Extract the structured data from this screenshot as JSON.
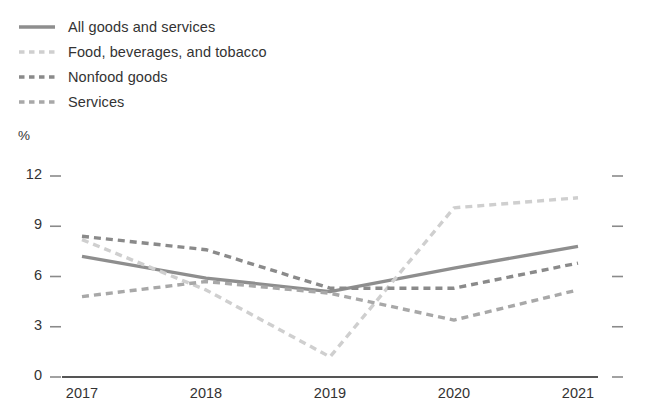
{
  "chart_data": {
    "type": "line",
    "title": "",
    "xlabel": "",
    "ylabel": "%",
    "unit_label": "%",
    "categories": [
      "2017",
      "2018",
      "2019",
      "2020",
      "2021"
    ],
    "x": [
      2017,
      2018,
      2019,
      2020,
      2021
    ],
    "ylim": [
      0,
      12
    ],
    "yticks": [
      0,
      3,
      6,
      9,
      12
    ],
    "ytick_labels": [
      "0",
      "3",
      "6",
      "9",
      "12"
    ],
    "grid": false,
    "legend_position": "top-left",
    "series": [
      {
        "name": "All goods and services",
        "style": "solid",
        "color": "#8e8e8e",
        "values": [
          7.2,
          5.9,
          5.1,
          6.5,
          7.8
        ]
      },
      {
        "name": "Food, beverages, and tobacco",
        "style": "dashed",
        "color": "#cfcfcf",
        "values": [
          8.2,
          5.2,
          1.2,
          10.1,
          10.7
        ]
      },
      {
        "name": "Nonfood goods",
        "style": "dashed",
        "color": "#8a8a8a",
        "values": [
          8.4,
          7.6,
          5.3,
          5.3,
          6.8
        ]
      },
      {
        "name": "Services",
        "style": "dashed",
        "color": "#a8a8a8",
        "values": [
          4.8,
          5.7,
          5.0,
          3.4,
          5.2
        ]
      }
    ]
  },
  "legend": {
    "items": [
      {
        "label": "All goods and services"
      },
      {
        "label": "Food, beverages, and tobacco"
      },
      {
        "label": "Nonfood goods"
      },
      {
        "label": "Services"
      }
    ]
  },
  "axes": {
    "y_unit": "%",
    "y_ticks": [
      "12",
      "9",
      "6",
      "3",
      "0"
    ],
    "x_ticks": [
      "2017",
      "2018",
      "2019",
      "2020",
      "2021"
    ]
  }
}
